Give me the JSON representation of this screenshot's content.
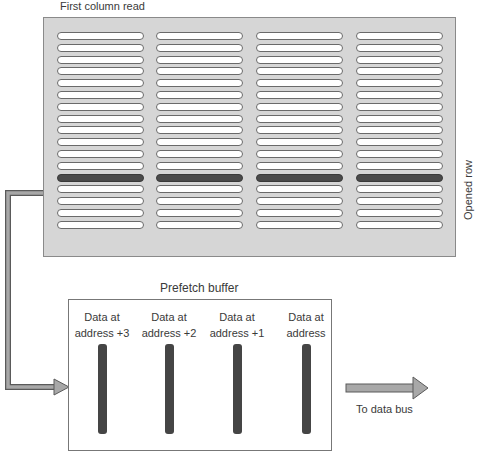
{
  "diagram": {
    "top_label": "First column read",
    "side_label": "Opened row",
    "grid": {
      "columns": 4,
      "rows": 17,
      "opened_row_index": 12,
      "colors": {
        "background": "#d6d6d6",
        "cell": "#ffffff",
        "opened_cell": "#4a4a4a",
        "border": "#8a8a8a"
      }
    },
    "buffer": {
      "title": "Prefetch buffer",
      "slots": [
        {
          "line1": "Data at",
          "line2": "address +3"
        },
        {
          "line1": "Data at",
          "line2": "address +2"
        },
        {
          "line1": "Data at",
          "line2": "address +1"
        },
        {
          "line1": "Data at",
          "line2": "address"
        }
      ]
    },
    "output_label": "To data bus",
    "arrow_color": "#9a9a9a"
  }
}
